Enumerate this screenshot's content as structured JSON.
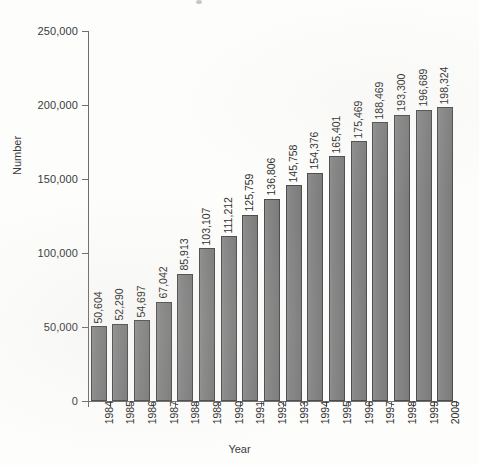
{
  "chart_data": {
    "type": "bar",
    "title": "",
    "xlabel": "Year",
    "ylabel": "Number",
    "categories": [
      "1984",
      "1985",
      "1986",
      "1987",
      "1988",
      "1989",
      "1990",
      "1991",
      "1992",
      "1993",
      "1994",
      "1995",
      "1996",
      "1997",
      "1998",
      "1999",
      "2000"
    ],
    "values": [
      50604,
      52290,
      54697,
      67042,
      85913,
      103107,
      111212,
      125759,
      136806,
      145758,
      154376,
      165401,
      175469,
      188469,
      193300,
      196689,
      198324
    ],
    "value_labels": [
      "50,604",
      "52,290",
      "54,697",
      "67,042",
      "85,913",
      "103,107",
      "111,212",
      "125,759",
      "136,806",
      "145,758",
      "154,376",
      "165,401",
      "175,469",
      "188,469",
      "193,300",
      "196,689",
      "198,324"
    ],
    "ylim": [
      0,
      250000
    ],
    "y_ticks": [
      0,
      50000,
      100000,
      150000,
      200000,
      250000
    ],
    "y_tick_labels": [
      "0",
      "50,000",
      "100,000",
      "150,000",
      "200,000",
      "250,000"
    ],
    "grid": false,
    "legend": null,
    "bar_color": "#858585",
    "bar_edge_color": "#4d4d4d",
    "axis_color": "#6e6e6e",
    "text_color": "#2f2f2f",
    "background_color": "#fdfdfb"
  }
}
